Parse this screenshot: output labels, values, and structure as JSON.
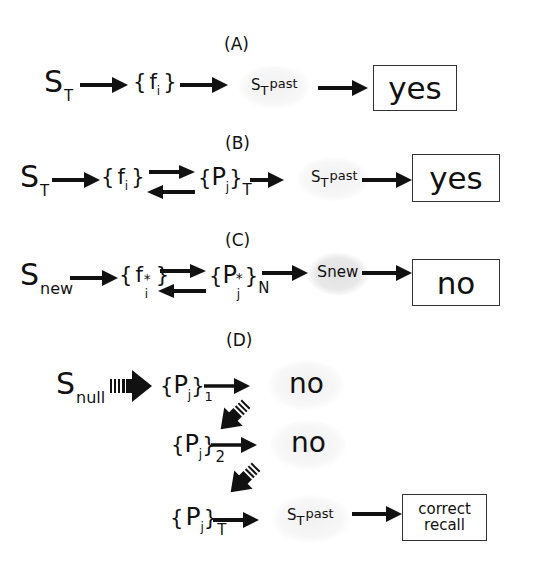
{
  "panels": {
    "A": {
      "label": "(A)",
      "input": {
        "base": "S",
        "sub": "T"
      },
      "features": {
        "open": "{",
        "base": "f",
        "sub": "i",
        "close": "}"
      },
      "memory": {
        "base": "S",
        "sub": "T",
        "sup": "past"
      },
      "output": "yes"
    },
    "B": {
      "label": "(B)",
      "input": {
        "base": "S",
        "sub": "T"
      },
      "features": {
        "open": "{",
        "base": "f",
        "sub": "i",
        "close": "}"
      },
      "pattern": {
        "open": "{",
        "base": "P",
        "sub": "j",
        "close": "}",
        "outer_sub": "T"
      },
      "memory": {
        "base": "S",
        "sub": "T",
        "sup": "past"
      },
      "output": "yes"
    },
    "C": {
      "label": "(C)",
      "input": {
        "base": "S",
        "sub": "new"
      },
      "features": {
        "open": "{",
        "base": "f",
        "star": "*",
        "sub": "i",
        "close": "}"
      },
      "pattern": {
        "open": "{",
        "base": "P",
        "star": "*",
        "sub": "j",
        "close": "}",
        "outer_sub": "N"
      },
      "memory": {
        "base": "S",
        "sub": "new"
      },
      "output": "no"
    },
    "D": {
      "label": "(D)",
      "input": {
        "base": "S",
        "sub": "null"
      },
      "steps": [
        {
          "pattern": {
            "open": "{",
            "base": "P",
            "sub": "j",
            "close": "}",
            "outer_sub": "1"
          },
          "result": "no"
        },
        {
          "pattern": {
            "open": "{",
            "base": "P",
            "sub": "j",
            "close": "}",
            "outer_sub": "2"
          },
          "result": "no"
        },
        {
          "pattern": {
            "open": "{",
            "base": "P",
            "sub": "j",
            "close": "}",
            "outer_sub": "T"
          },
          "memory": {
            "base": "S",
            "sub": "T",
            "sup": "past"
          },
          "result": "correct recall"
        }
      ],
      "output_line1": "correct",
      "output_line2": "recall"
    }
  },
  "colors": {
    "ink": "#111111",
    "glow": "#f1f1f1",
    "glow_gray": "#e4e4e4",
    "box_border": "#333333"
  }
}
